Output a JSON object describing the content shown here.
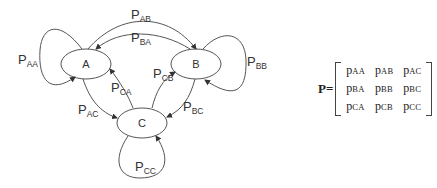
{
  "diagram": {
    "states": [
      {
        "id": "A",
        "label": "A"
      },
      {
        "id": "B",
        "label": "B"
      },
      {
        "id": "C",
        "label": "C"
      }
    ],
    "transitions": [
      {
        "from": "A",
        "to": "A",
        "label": "P",
        "sub": "AA"
      },
      {
        "from": "A",
        "to": "B",
        "label": "P",
        "sub": "AB"
      },
      {
        "from": "B",
        "to": "A",
        "label": "P",
        "sub": "BA"
      },
      {
        "from": "B",
        "to": "B",
        "label": "P",
        "sub": "BB"
      },
      {
        "from": "C",
        "to": "B",
        "label": "P",
        "sub": "CB"
      },
      {
        "from": "C",
        "to": "A",
        "label": "P",
        "sub": "CA"
      },
      {
        "from": "A",
        "to": "C",
        "label": "P",
        "sub": "AC"
      },
      {
        "from": "B",
        "to": "C",
        "label": "P",
        "sub": "BC"
      },
      {
        "from": "C",
        "to": "C",
        "label": "P",
        "sub": "CC"
      }
    ],
    "colors": {
      "stroke": "#555555",
      "text": "#333333",
      "background": "#ffffff"
    }
  },
  "matrix": {
    "name": "P=",
    "rows": [
      [
        {
          "p": "p",
          "sub": "AA"
        },
        {
          "p": "p",
          "sub": "AB"
        },
        {
          "p": "p",
          "sub": "AC"
        }
      ],
      [
        {
          "p": "p",
          "sub": "BA"
        },
        {
          "p": "p",
          "sub": "BB"
        },
        {
          "p": "p",
          "sub": "BC"
        }
      ],
      [
        {
          "p": "p",
          "sub": "CA"
        },
        {
          "p": "p",
          "sub": "CB"
        },
        {
          "p": "p",
          "sub": "CC"
        }
      ]
    ]
  }
}
